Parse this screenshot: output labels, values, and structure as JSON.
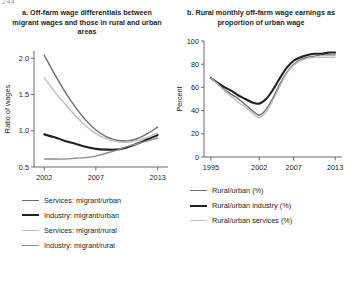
{
  "figure": {
    "number": "244"
  },
  "panels": [
    {
      "id": "panel-a",
      "title": "a. Off-farm wage differentials between migrant wages and those in rural and urban areas",
      "ylabel": "Ratio of wages",
      "xlabel": "",
      "legend": [
        {
          "label": "Services: migrant/urban",
          "color": "#6d6e71",
          "width": 1.6
        },
        {
          "label": "Industry: migrant/urban",
          "color": "#231f20",
          "width": 2.4
        },
        {
          "label": "Services: migrant/rural",
          "color": "#bcbec0",
          "width": 1.6
        },
        {
          "label": "Industry: migrant/rural",
          "color": "#8c8d8f",
          "width": 1.6
        }
      ]
    },
    {
      "id": "panel-b",
      "title": "b. Rural monthly off-farm wage earnings as proportion of urban wage",
      "ylabel": "Percent",
      "xlabel": "",
      "legend": [
        {
          "label": "Rural/urban (%)",
          "color": "#6d6e71",
          "width": 1.6
        },
        {
          "label": "Rural/urban industry (%)",
          "color": "#231f20",
          "width": 2.4
        },
        {
          "label": "Rural/urban services (%)",
          "color": "#bcbec0",
          "width": 1.6
        }
      ]
    }
  ],
  "chart_data": [
    {
      "type": "line",
      "id": "chart-a",
      "title": "a. Off-farm wage differentials between migrant wages and those in rural and urban areas",
      "xlabel": "",
      "ylabel": "Ratio of wages",
      "xlim": [
        2001,
        2014
      ],
      "ylim": [
        0.5,
        2.1
      ],
      "xticks": [
        2002,
        2007,
        2013
      ],
      "xticklabels": [
        "2002",
        "2007",
        "2013"
      ],
      "yticks": [
        0.5,
        1.0,
        1.5,
        2.0
      ],
      "yticklabels": [
        "0.5",
        "1.0",
        "1.5",
        "2.0"
      ],
      "grid": false,
      "legend_position": "below",
      "x": [
        2002,
        2003,
        2004,
        2005,
        2006,
        2007,
        2008,
        2009,
        2010,
        2011,
        2012,
        2013
      ],
      "series": [
        {
          "name": "Services: migrant/urban",
          "color": "#6d6e71",
          "values": [
            2.04,
            1.78,
            1.54,
            1.33,
            1.15,
            1.01,
            0.92,
            0.87,
            0.86,
            0.89,
            0.96,
            1.05
          ]
        },
        {
          "name": "Industry: migrant/urban",
          "color": "#231f20",
          "values": [
            0.95,
            0.91,
            0.86,
            0.82,
            0.78,
            0.75,
            0.74,
            0.74,
            0.77,
            0.82,
            0.88,
            0.94
          ]
        },
        {
          "name": "Services: migrant/rural",
          "color": "#bcbec0",
          "values": [
            1.73,
            1.54,
            1.37,
            1.21,
            1.07,
            0.96,
            0.89,
            0.85,
            0.84,
            0.86,
            0.91,
            0.97
          ]
        },
        {
          "name": "Industry: migrant/rural",
          "color": "#8c8d8f",
          "values": [
            0.61,
            0.61,
            0.61,
            0.62,
            0.63,
            0.65,
            0.69,
            0.73,
            0.78,
            0.82,
            0.86,
            0.9
          ]
        }
      ]
    },
    {
      "type": "line",
      "id": "chart-b",
      "title": "b. Rural monthly off-farm wage earnings as proportion of urban wage",
      "xlabel": "",
      "ylabel": "Percent",
      "xlim": [
        1994,
        2014
      ],
      "ylim": [
        0,
        100
      ],
      "xticks": [
        1995,
        2002,
        2007,
        2013
      ],
      "xticklabels": [
        "1995",
        "2002",
        "2007",
        "2013"
      ],
      "yticks": [
        0,
        20,
        40,
        60,
        80,
        100
      ],
      "yticklabels": [
        "0",
        "20",
        "40",
        "60",
        "80",
        "100"
      ],
      "grid": false,
      "legend_position": "below",
      "x": [
        1995,
        1996,
        1997,
        1998,
        1999,
        2000,
        2001,
        2002,
        2003,
        2004,
        2005,
        2006,
        2007,
        2008,
        2009,
        2010,
        2011,
        2012,
        2013
      ],
      "series": [
        {
          "name": "Rural/urban (%)",
          "color": "#6d6e71",
          "values": [
            68,
            63,
            58,
            54,
            50,
            45,
            40,
            36,
            41,
            51,
            63,
            73,
            80,
            84,
            86,
            87,
            88,
            88,
            88
          ]
        },
        {
          "name": "Rural/urban industry (%)",
          "color": "#231f20",
          "values": [
            68,
            64,
            60,
            57,
            53,
            50,
            47,
            46,
            50,
            58,
            68,
            77,
            83,
            86,
            88,
            89,
            89,
            90,
            90
          ]
        },
        {
          "name": "Rural/urban services (%)",
          "color": "#bcbec0",
          "values": [
            68,
            63,
            57,
            52,
            47,
            43,
            38,
            34,
            39,
            49,
            61,
            72,
            79,
            83,
            85,
            86,
            86,
            86,
            86
          ]
        }
      ]
    }
  ]
}
